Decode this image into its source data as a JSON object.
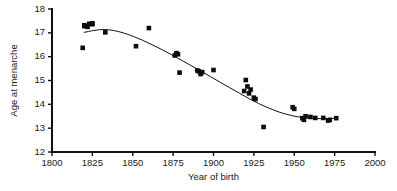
{
  "figure": {
    "background_color": "#ffffff",
    "marker_color": "#0c0c0c",
    "curve_color": "#121212",
    "axis_color": "#111111"
  },
  "chart_data": {
    "type": "scatter",
    "title": "",
    "subtitle": "",
    "xlabel": "Year of birth",
    "ylabel": "Age at menarche",
    "xlim": [
      1800,
      2000
    ],
    "ylim": [
      12,
      18
    ],
    "xticks": [
      1800,
      1825,
      1850,
      1875,
      1900,
      1925,
      1950,
      1975,
      2000
    ],
    "xtick_labels": [
      "1800",
      "1825",
      "1850",
      "1875",
      "1900",
      "1925",
      "1950",
      "1975",
      "2000"
    ],
    "yticks": [
      12,
      13,
      14,
      15,
      16,
      17,
      18
    ],
    "ytick_labels": [
      "12",
      "13",
      "14",
      "15",
      "16",
      "17",
      "18"
    ],
    "grid": false,
    "legend": false,
    "legend_position": "none",
    "marker_shape": "square",
    "series": [
      {
        "name": "Age at menarche",
        "x": [
          1819,
          1820,
          1820,
          1822,
          1823,
          1825,
          1825,
          1833,
          1852,
          1860,
          1876,
          1877,
          1878,
          1879,
          1890,
          1891,
          1892,
          1893,
          1900,
          1919,
          1920,
          1921,
          1922,
          1923,
          1925,
          1926,
          1931,
          1949,
          1950,
          1955,
          1956,
          1957,
          1960,
          1963,
          1968,
          1971,
          1972,
          1976
        ],
        "y": [
          16.37,
          17.28,
          17.32,
          17.25,
          17.38,
          17.36,
          17.4,
          17.02,
          16.44,
          17.2,
          16.05,
          16.15,
          16.1,
          15.33,
          15.42,
          15.38,
          15.27,
          15.35,
          15.44,
          14.56,
          15.02,
          14.75,
          14.46,
          14.62,
          14.28,
          14.22,
          13.05,
          13.88,
          13.81,
          13.42,
          13.35,
          13.5,
          13.47,
          13.43,
          13.43,
          13.32,
          13.35,
          13.42
        ]
      }
    ],
    "fit_curve": {
      "name": "fitted trend",
      "description": "smoothed polynomial fit through the scatter",
      "x": [
        1820,
        1826,
        1832,
        1838,
        1844,
        1850,
        1856,
        1862,
        1868,
        1874,
        1880,
        1886,
        1892,
        1898,
        1904,
        1910,
        1916,
        1922,
        1928,
        1934,
        1940,
        1946,
        1952,
        1958,
        1964,
        1970,
        1976
      ],
      "y": [
        17.02,
        17.1,
        17.14,
        17.1,
        17.0,
        16.86,
        16.69,
        16.5,
        16.3,
        16.08,
        15.86,
        15.63,
        15.4,
        15.17,
        14.93,
        14.7,
        14.47,
        14.24,
        14.03,
        13.85,
        13.69,
        13.57,
        13.48,
        13.43,
        13.4,
        13.4,
        13.42
      ]
    },
    "annotations": []
  }
}
